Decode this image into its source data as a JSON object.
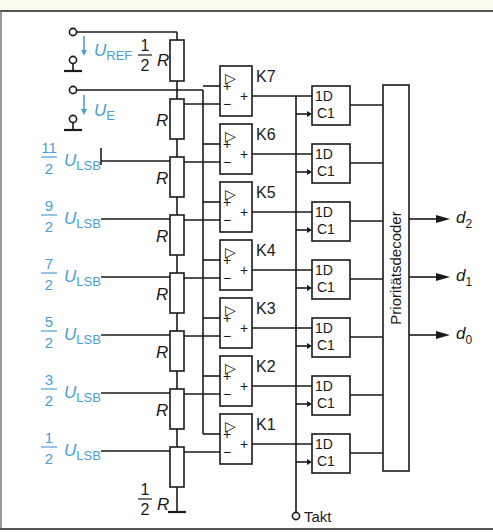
{
  "diagram": {
    "colors": {
      "wire": "#1a1a1a",
      "accent_blue": "#4a9fd8",
      "top_band": "#fcfbf0"
    },
    "inputs": {
      "reference": {
        "symbol": "U",
        "subscript": "REF"
      },
      "input": {
        "symbol": "U",
        "subscript": "E"
      }
    },
    "resistors": {
      "top": {
        "num": "1",
        "den": "2",
        "label": "R"
      },
      "middle_label": "R",
      "bottom": {
        "num": "1",
        "den": "2",
        "label": "R"
      }
    },
    "thresholds": [
      {
        "num": "11",
        "den": "2",
        "symbol": "U",
        "subscript": "LSB"
      },
      {
        "num": "9",
        "den": "2",
        "symbol": "U",
        "subscript": "LSB"
      },
      {
        "num": "7",
        "den": "2",
        "symbol": "U",
        "subscript": "LSB"
      },
      {
        "num": "5",
        "den": "2",
        "symbol": "U",
        "subscript": "LSB"
      },
      {
        "num": "3",
        "den": "2",
        "symbol": "U",
        "subscript": "LSB"
      },
      {
        "num": "1",
        "den": "2",
        "symbol": "U",
        "subscript": "LSB"
      }
    ],
    "comparators": [
      {
        "label": "K7",
        "glyph": "▷",
        "in_plus": "+",
        "in_minus": "−",
        "out": "+"
      },
      {
        "label": "K6",
        "glyph": "▷",
        "in_plus": "+",
        "in_minus": "−",
        "out": "+"
      },
      {
        "label": "K5",
        "glyph": "▷",
        "in_plus": "+",
        "in_minus": "−",
        "out": "+"
      },
      {
        "label": "K4",
        "glyph": "▷",
        "in_plus": "+",
        "in_minus": "−",
        "out": "+"
      },
      {
        "label": "K3",
        "glyph": "▷",
        "in_plus": "+",
        "in_minus": "−",
        "out": "+"
      },
      {
        "label": "K2",
        "glyph": "▷",
        "in_plus": "+",
        "in_minus": "−",
        "out": "+"
      },
      {
        "label": "K1",
        "glyph": "▷",
        "in_plus": "+",
        "in_minus": "−",
        "out": "+"
      }
    ],
    "flipflops": {
      "d_label": "1D",
      "c_label": "C1",
      "count": 7
    },
    "decoder": {
      "label": "Prioritätsdecoder"
    },
    "outputs": [
      {
        "symbol": "d",
        "subscript": "2"
      },
      {
        "symbol": "d",
        "subscript": "1"
      },
      {
        "symbol": "d",
        "subscript": "0"
      }
    ],
    "clock": {
      "label": "Takt"
    }
  }
}
